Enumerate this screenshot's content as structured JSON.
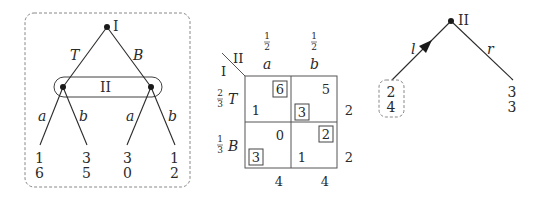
{
  "extensive_game": {
    "root_player": "I",
    "root_actions": [
      "T",
      "B"
    ],
    "info_set_player": "II",
    "info_set_actions": [
      "a",
      "b",
      "a",
      "b"
    ],
    "payoffs": [
      {
        "p1": "1",
        "p2": "6"
      },
      {
        "p1": "3",
        "p2": "5"
      },
      {
        "p1": "3",
        "p2": "0"
      },
      {
        "p1": "1",
        "p2": "2"
      }
    ]
  },
  "matrix_game": {
    "row_player": "I",
    "col_player": "II",
    "col_probs": [
      "1/2",
      "1/2"
    ],
    "col_actions": [
      "a",
      "b"
    ],
    "row_probs": [
      "2/3",
      "1/3"
    ],
    "row_actions": [
      "T",
      "B"
    ],
    "cells": [
      [
        {
          "p1": "1",
          "p2": "6",
          "p1_boxed": false,
          "p2_boxed": true
        },
        {
          "p1": "3",
          "p2": "5",
          "p1_boxed": true,
          "p2_boxed": false
        }
      ],
      [
        {
          "p1": "3",
          "p2": "0",
          "p1_boxed": true,
          "p2_boxed": false
        },
        {
          "p1": "1",
          "p2": "2",
          "p1_boxed": false,
          "p2_boxed": true
        }
      ]
    ],
    "row_expected": [
      "2",
      "2"
    ],
    "col_expected": [
      "4",
      "4"
    ]
  },
  "reduced_game": {
    "player": "II",
    "actions": [
      "l",
      "r"
    ],
    "chosen_action": "l",
    "payoffs": [
      {
        "p1": "2",
        "p2": "4",
        "highlighted": true
      },
      {
        "p1": "3",
        "p2": "3",
        "highlighted": false
      }
    ]
  }
}
